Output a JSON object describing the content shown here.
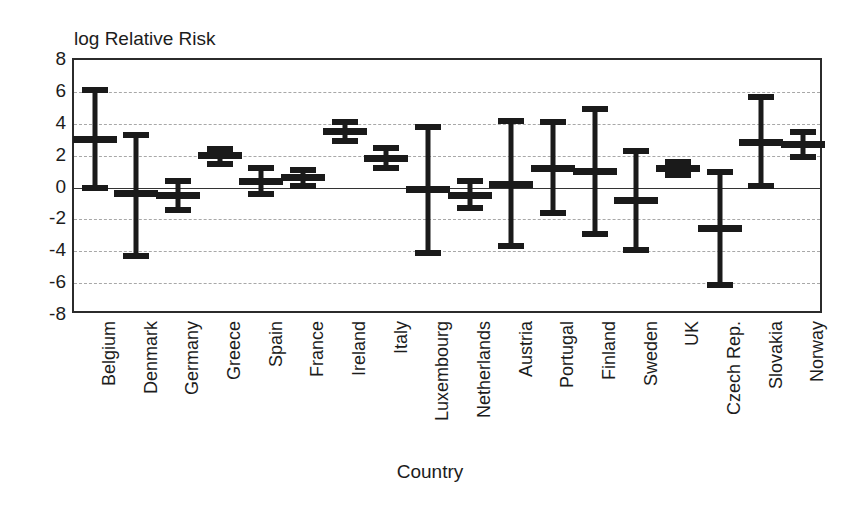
{
  "chart_data": {
    "type": "scatter",
    "title": "",
    "ylabel": "log Relative Risk",
    "xlabel": "Country",
    "ylim": [
      -8,
      8
    ],
    "yticks": [
      8,
      6,
      4,
      2,
      0,
      -2,
      -4,
      -6,
      -8
    ],
    "ytick_labels": [
      "8",
      "6",
      "4",
      "2",
      "0",
      "-2",
      "-4",
      "-6",
      "-8"
    ],
    "grid": true,
    "gridlines_at": [
      6,
      4,
      2,
      -2,
      -4,
      -6
    ],
    "zero_reference_line": 0,
    "legend": null,
    "marker_style": "error-bar-with-center-tick",
    "categories": [
      "Belgium",
      "Denmark",
      "Germany",
      "Greece",
      "Spain",
      "France",
      "Ireland",
      "Italy",
      "Luxembourg",
      "Netherlands",
      "Austria",
      "Portugal",
      "Finland",
      "Sweden",
      "UK",
      "Czech Rep.",
      "Slovakia",
      "Norway"
    ],
    "points": [
      {
        "category": "Belgium",
        "value": 3.0,
        "low": 0.0,
        "high": 6.1
      },
      {
        "category": "Denmark",
        "value": -0.4,
        "low": -4.3,
        "high": 3.3
      },
      {
        "category": "Germany",
        "value": -0.5,
        "low": -1.4,
        "high": 0.4
      },
      {
        "category": "Greece",
        "value": 2.0,
        "low": 1.5,
        "high": 2.4
      },
      {
        "category": "Spain",
        "value": 0.4,
        "low": -0.4,
        "high": 1.2
      },
      {
        "category": "France",
        "value": 0.6,
        "low": 0.1,
        "high": 1.1
      },
      {
        "category": "Ireland",
        "value": 3.5,
        "low": 2.9,
        "high": 4.1
      },
      {
        "category": "Italy",
        "value": 1.8,
        "low": 1.2,
        "high": 2.5
      },
      {
        "category": "Luxembourg",
        "value": -0.1,
        "low": -4.1,
        "high": 3.8
      },
      {
        "category": "Netherlands",
        "value": -0.5,
        "low": -1.3,
        "high": 0.4
      },
      {
        "category": "Austria",
        "value": 0.2,
        "low": -3.7,
        "high": 4.2
      },
      {
        "category": "Portugal",
        "value": 1.2,
        "low": -1.6,
        "high": 4.1
      },
      {
        "category": "Finland",
        "value": 1.0,
        "low": -2.9,
        "high": 4.9
      },
      {
        "category": "Sweden",
        "value": -0.8,
        "low": -3.9,
        "high": 2.3
      },
      {
        "category": "UK",
        "value": 1.2,
        "low": 0.8,
        "high": 1.6
      },
      {
        "category": "Czech Rep.",
        "value": -2.6,
        "low": -6.1,
        "high": 1.0
      },
      {
        "category": "Slovakia",
        "value": 2.8,
        "low": 0.1,
        "high": 5.7
      },
      {
        "category": "Norway",
        "value": 2.7,
        "low": 1.9,
        "high": 3.5
      }
    ]
  },
  "colors": {
    "marker": "#1a1a1a",
    "frame": "#2b2b2b",
    "grid": "#a8a8a8",
    "zero": "#333333",
    "text": "#1c1c1c",
    "background": "#ffffff"
  }
}
